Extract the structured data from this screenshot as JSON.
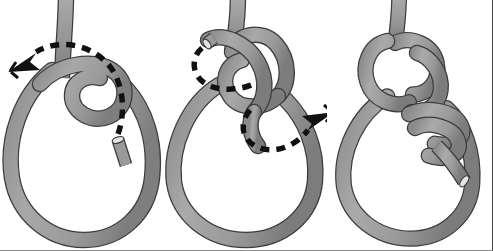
{
  "figure": {
    "background_color": "#ffffff",
    "border_color": "#4a4a4a",
    "panel_count": 3,
    "width": 493,
    "height": 251
  },
  "palette": {
    "rope_fill": "#9a9a9a",
    "rope_fill_light": "#b3b3b3",
    "rope_fill_dark": "#7d7d7d",
    "rope_outline": "#3c3c3c",
    "rope_end_face": "#d8d8d8",
    "arrow_color": "#111111",
    "background": "#ffffff"
  },
  "panels": [
    {
      "id": "panel-1",
      "label": "Step 1",
      "description": "Rope loop with working end crossed over to form a small eye; dashed arrow curls up and to the left.",
      "arrow": {
        "name": "motion-arrow-left",
        "direction": "left",
        "style": "dashed",
        "color": "#111111",
        "tip_x": 8,
        "tip_y": 72
      },
      "elements": [
        "standing-part",
        "main-bight-loop",
        "overhand-crossing-loop",
        "working-end"
      ]
    },
    {
      "id": "panel-2",
      "label": "Step 2",
      "description": "Working end tucked through the eye forming an interlaced knot; dashed arrow curves around to the right.",
      "arrow": {
        "name": "motion-arrow-right",
        "direction": "right",
        "style": "dashed",
        "color": "#111111",
        "tip_x": 487,
        "tip_y": 118
      },
      "elements": [
        "standing-part",
        "main-bight-loop",
        "interlaced-knot",
        "working-end-path"
      ]
    },
    {
      "id": "panel-3",
      "label": "Step 3",
      "description": "Finished knot drawn tight with wrapping coils and the rope tail protruding to the lower right.",
      "arrow": null,
      "elements": [
        "standing-part",
        "main-bight-loop",
        "finished-knot",
        "wrapping-coils",
        "rope-tail"
      ]
    }
  ]
}
